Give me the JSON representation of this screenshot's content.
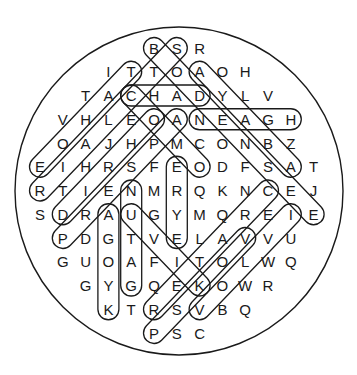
{
  "puzzle": {
    "type": "word-search",
    "shape": "circle",
    "grid_origin": {
      "x": 40,
      "y": 48,
      "dx": 22.8,
      "dy": 23.75
    },
    "circle": {
      "cx": 179,
      "cy": 191,
      "r": 164
    },
    "rows": [
      {
        "start_col": 5,
        "letters": "BSR"
      },
      {
        "start_col": 3,
        "letters": "ITTOAOH"
      },
      {
        "start_col": 2,
        "letters": "TACHADYLV"
      },
      {
        "start_col": 1,
        "letters": "VHLEOANEAGH"
      },
      {
        "start_col": 1,
        "letters": "OAJHPMCONBZ"
      },
      {
        "start_col": 0,
        "letters": "EIHRSFEODFSAT"
      },
      {
        "start_col": 0,
        "letters": "RTIENMRQKNCEJ"
      },
      {
        "start_col": 0,
        "letters": "SDRAUGYMQREIE"
      },
      {
        "start_col": 1,
        "letters": "PDGTVELAVVU"
      },
      {
        "start_col": 1,
        "letters": "GUOAFITOLWQ"
      },
      {
        "start_col": 2,
        "letters": "GYGQEKOWR"
      },
      {
        "start_col": 3,
        "letters": "KTRSVBQ"
      },
      {
        "start_col": 5,
        "letters": "PSC"
      }
    ],
    "found_words": [
      {
        "word": "CHAD",
        "from": [
          2,
          4
        ],
        "to": [
          2,
          7
        ]
      },
      {
        "word": "NEAGH",
        "from": [
          3,
          7
        ],
        "to": [
          3,
          11
        ]
      },
      {
        "word": "TAHOE",
        "from": [
          1,
          4
        ],
        "to": [
          5,
          0
        ]
      },
      {
        "word": "STCLAIR",
        "from": [
          0,
          6
        ],
        "to": [
          6,
          0
        ]
      },
      {
        "word": "OHRID",
        "from": [
          3,
          5
        ],
        "to": [
          7,
          1
        ]
      },
      {
        "word": "PRESPA",
        "from": [
          8,
          1
        ],
        "to": [
          3,
          6
        ]
      },
      {
        "word": "BODENSEE",
        "from": [
          0,
          5
        ],
        "to": [
          7,
          12
        ]
      },
      {
        "word": "ABAYA",
        "from": [
          5,
          11
        ],
        "to": [
          1,
          7
        ]
      },
      {
        "word": "COMO",
        "from": [
          2,
          4
        ],
        "to": [
          5,
          7
        ]
      },
      {
        "word": "EYRE",
        "from": [
          8,
          6
        ],
        "to": [
          5,
          6
        ]
      },
      {
        "word": "GATUN",
        "from": [
          10,
          4
        ],
        "to": [
          6,
          4
        ]
      },
      {
        "word": "KYOGA",
        "from": [
          11,
          3
        ],
        "to": [
          7,
          3
        ]
      },
      {
        "word": "KIVU",
        "from": [
          10,
          7
        ],
        "to": [
          7,
          4
        ]
      },
      {
        "word": "VOLVI",
        "from": [
          11,
          7
        ],
        "to": [
          7,
          11
        ]
      },
      {
        "word": "CRATER",
        "from": [
          6,
          10
        ],
        "to": [
          11,
          5
        ]
      },
      {
        "word": "PSKOV",
        "from": [
          12,
          5
        ],
        "to": [
          8,
          9
        ]
      }
    ]
  }
}
